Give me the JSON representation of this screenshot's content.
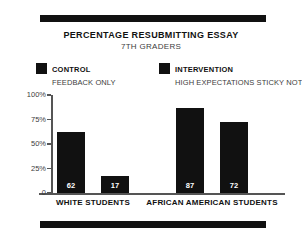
{
  "clipped_top_text": "",
  "chart_data": {
    "type": "bar",
    "title": "PERCENTAGE RESUBMITTING ESSAY",
    "subtitle": "7TH GRADERS",
    "xlabel": "",
    "ylabel": "",
    "ylim": [
      0,
      100
    ],
    "grid": false,
    "legend_position": "top",
    "y_ticks": [
      {
        "value": 100,
        "label": "100%"
      },
      {
        "value": 75,
        "label": "75%"
      },
      {
        "value": 50,
        "label": "50%"
      },
      {
        "value": 25,
        "label": "25%"
      },
      {
        "value": 0,
        "label": "0"
      }
    ],
    "categories": [
      "WHITE STUDENTS",
      "AFRICAN AMERICAN STUDENTS"
    ],
    "series": [
      {
        "name": "CONTROL",
        "description": "FEEDBACK ONLY",
        "color": "#111111",
        "values": [
          62,
          87
        ]
      },
      {
        "name": "INTERVENTION",
        "description": "HIGH EXPECTATIONS STICKY NOTES",
        "color": "#111111",
        "values": [
          17,
          72
        ]
      }
    ],
    "bars": [
      {
        "label": "62",
        "value": 62,
        "category": "WHITE STUDENTS",
        "series": "CONTROL"
      },
      {
        "label": "87",
        "value": 87,
        "category": "WHITE STUDENTS",
        "series": "INTERVENTION"
      },
      {
        "label": "17",
        "value": 17,
        "category": "AFRICAN AMERICAN STUDENTS",
        "series": "CONTROL"
      },
      {
        "label": "72",
        "value": 72,
        "category": "AFRICAN AMERICAN STUDENTS",
        "series": "INTERVENTION"
      }
    ]
  },
  "legend": {
    "items": [
      {
        "name": "CONTROL",
        "description": "FEEDBACK ONLY"
      },
      {
        "name": "INTERVENTION",
        "description": "HIGH EXPECTATIONS STICKY NOTES"
      }
    ]
  },
  "colors": {
    "bar": "#111111",
    "rule": "#111111",
    "axis": "#555555",
    "title": "#111111",
    "subtitle": "#3d3d3d",
    "value_label": "#ffffff"
  }
}
